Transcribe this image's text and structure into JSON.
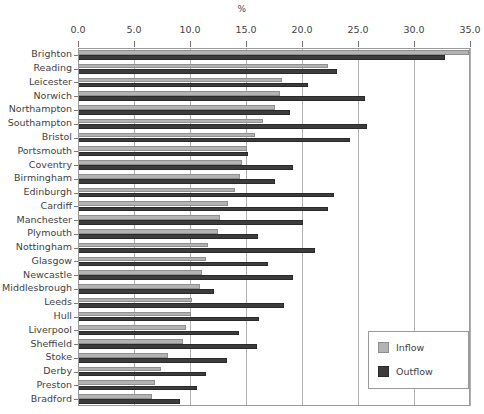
{
  "chart_data": {
    "type": "bar",
    "orientation": "horizontal",
    "title": "",
    "xlabel": "%",
    "ylabel": "",
    "xlim": [
      0.0,
      35.0
    ],
    "xticks": [
      "0.0",
      "5.0",
      "10.0",
      "15.0",
      "20.0",
      "25.0",
      "30.0",
      "35.0"
    ],
    "xtick_values": [
      0,
      5,
      10,
      15,
      20,
      25,
      30,
      35
    ],
    "grid": "vertical",
    "legend_position": "bottom-right",
    "categories": [
      "Brighton",
      "Reading",
      "Leicester",
      "Norwich",
      "Northampton",
      "Southampton",
      "Bristol",
      "Portsmouth",
      "Coventry",
      "Birmingham",
      "Edinburgh",
      "Cardiff",
      "Manchester",
      "Plymouth",
      "Nottingham",
      "Glasgow",
      "Newcastle",
      "Middlesbrough",
      "Leeds",
      "Hull",
      "Liverpool",
      "Sheffield",
      "Stoke",
      "Derby",
      "Preston",
      "Bradford"
    ],
    "series": [
      {
        "name": "Inflow",
        "color": "#b3b3b3",
        "values": [
          34.9,
          22.3,
          18.2,
          18.0,
          17.6,
          16.5,
          15.8,
          15.1,
          14.6,
          14.5,
          14.0,
          13.4,
          12.7,
          12.5,
          11.6,
          11.4,
          11.1,
          10.9,
          10.2,
          10.1,
          9.6,
          9.4,
          8.0,
          7.4,
          6.9,
          6.6
        ]
      },
      {
        "name": "Outflow",
        "color": "#3c3c3c",
        "values": [
          32.8,
          23.1,
          20.5,
          25.6,
          18.9,
          25.8,
          24.3,
          15.2,
          19.2,
          17.6,
          22.9,
          22.3,
          20.1,
          16.1,
          21.2,
          17.0,
          19.2,
          12.1,
          18.4,
          16.2,
          14.4,
          16.0,
          13.3,
          11.4,
          10.6,
          9.1
        ]
      }
    ]
  },
  "legend": {
    "items": [
      {
        "label": "Inflow",
        "swatch": "inflow-swatch"
      },
      {
        "label": "Outflow",
        "swatch": "outflow-swatch"
      }
    ]
  }
}
